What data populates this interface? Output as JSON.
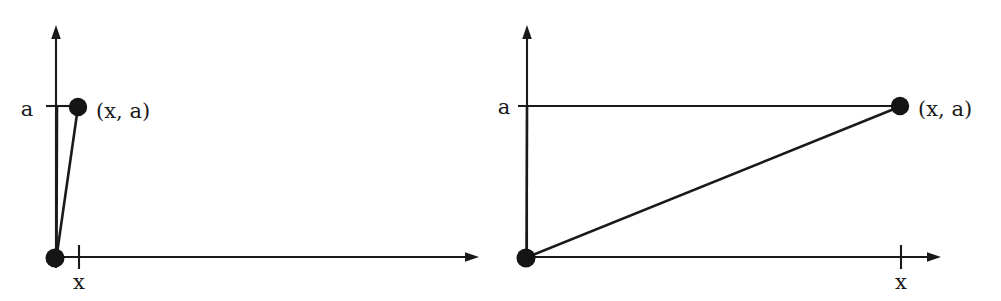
{
  "figure": {
    "background_color": "#ffffff",
    "ink_color": "#1a1a1a",
    "panels": [
      {
        "id": "left",
        "name": "small-x-panel",
        "origin": {
          "x": 56,
          "y": 258
        },
        "y_axis": {
          "x": 56,
          "top_y": 28,
          "bottom_y": 268,
          "arrow": "up"
        },
        "x_axis": {
          "y": 257,
          "left_x": 56,
          "right_x": 478,
          "arrow": "right"
        },
        "point": {
          "x": 78,
          "y": 107,
          "label": "(x, a)",
          "label_x": 96,
          "label_y": 112
        },
        "y_tick": {
          "y": 106,
          "from_x": 46,
          "to_x": 70,
          "label": "a",
          "label_x": 27,
          "label_y": 110
        },
        "x_tick": {
          "x": 79,
          "from_y": 246,
          "to_y": 268,
          "label": "x",
          "label_x": 72,
          "label_y": 281
        },
        "segments": [
          {
            "name": "vertical-leg",
            "from": [
              56,
              258
            ],
            "to": [
              56,
              107
            ]
          },
          {
            "name": "hypotenuse",
            "from": [
              56,
              258
            ],
            "to": [
              78,
              107
            ]
          }
        ]
      },
      {
        "id": "right",
        "name": "large-x-panel",
        "origin": {
          "x": 526,
          "y": 258
        },
        "y_axis": {
          "x": 527,
          "top_y": 28,
          "bottom_y": 262,
          "arrow": "up"
        },
        "x_axis": {
          "y": 257,
          "left_x": 526,
          "right_x": 940,
          "arrow": "right"
        },
        "point": {
          "x": 900,
          "y": 106,
          "label": "(x, a)",
          "label_x": 918,
          "label_y": 110
        },
        "y_tick": {
          "y": 106,
          "from_x": 518,
          "to_x": 900,
          "label": "a",
          "label_x": 503,
          "label_y": 108
        },
        "x_tick": {
          "x": 901,
          "from_y": 246,
          "to_y": 268,
          "label": "x",
          "label_x": 895,
          "label_y": 281
        },
        "segments": [
          {
            "name": "vertical-leg",
            "from": [
              526,
              258
            ],
            "to": [
              527,
              106
            ]
          },
          {
            "name": "hypotenuse",
            "from": [
              526,
              258
            ],
            "to": [
              900,
              106
            ]
          }
        ]
      }
    ],
    "labels": {
      "coordinate_left": "(x, a)",
      "coordinate_right": "(x, a)",
      "y_value_left": "a",
      "y_value_right": "a",
      "x_value_left": "x",
      "x_value_right": "x"
    }
  }
}
